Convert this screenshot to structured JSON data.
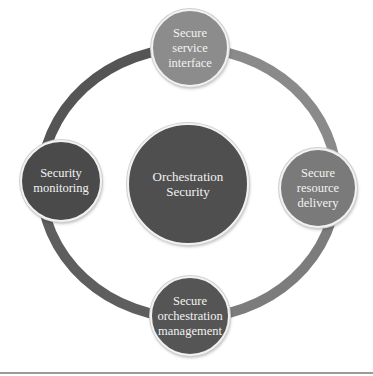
{
  "diagram": {
    "center": {
      "label": "Orchestration Security",
      "color": "#4f4f4f"
    },
    "nodes": [
      {
        "id": "top",
        "label": "Secure service interface",
        "color": "#8c8c8c"
      },
      {
        "id": "right",
        "label": "Secure resource delivery",
        "color": "#7a7a7a"
      },
      {
        "id": "bottom",
        "label": "Secure orchestration management",
        "color": "#555555"
      },
      {
        "id": "left",
        "label": "Security monitoring",
        "color": "#4a4a4a"
      }
    ],
    "ring_segments": [
      {
        "from": "top",
        "to": "right",
        "color": "#8a8a8a"
      },
      {
        "from": "right",
        "to": "bottom",
        "color": "#7c7c7c"
      },
      {
        "from": "bottom",
        "to": "left",
        "color": "#5e5e5e"
      },
      {
        "from": "left",
        "to": "top",
        "color": "#555555"
      }
    ]
  }
}
